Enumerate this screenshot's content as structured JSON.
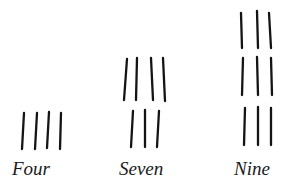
{
  "diagram": {
    "type": "tally-groupings",
    "groups": [
      {
        "label": "Four",
        "count": 4,
        "rows": [
          {
            "strokes": [
              [
                24,
                113,
                22,
                149
              ],
              [
                37,
                113,
                35,
                149
              ],
              [
                49,
                112,
                47,
                148
              ],
              [
                61,
                113,
                60,
                149
              ]
            ]
          }
        ],
        "label_pos": {
          "x": 12,
          "y": 159
        }
      },
      {
        "label": "Seven",
        "count": 7,
        "rows": [
          {
            "strokes": [
              [
                127,
                59,
                124,
                100
              ],
              [
                137,
                58,
                136,
                100
              ],
              [
                151,
                58,
                153,
                100
              ],
              [
                163,
                58,
                165,
                101
              ]
            ]
          },
          {
            "strokes": [
              [
                133,
                111,
                131,
                147
              ],
              [
                145,
                110,
                145,
                147
              ],
              [
                159,
                111,
                157,
                147
              ]
            ]
          }
        ],
        "label_pos": {
          "x": 119,
          "y": 159
        }
      },
      {
        "label": "Nine",
        "count": 9,
        "rows": [
          {
            "strokes": [
              [
                241,
                13,
                242,
                48
              ],
              [
                257,
                11,
                258,
                48
              ],
              [
                269,
                13,
                271,
                48
              ]
            ]
          },
          {
            "strokes": [
              [
                243,
                58,
                242,
                95
              ],
              [
                257,
                57,
                258,
                95
              ],
              [
                271,
                58,
                272,
                95
              ]
            ]
          },
          {
            "strokes": [
              [
                245,
                108,
                244,
                145
              ],
              [
                258,
                107,
                258,
                145
              ],
              [
                271,
                108,
                271,
                145
              ]
            ]
          }
        ],
        "label_pos": {
          "x": 234,
          "y": 159
        }
      }
    ],
    "colors": {
      "ink": "#141414",
      "background": "#ffffff"
    }
  }
}
